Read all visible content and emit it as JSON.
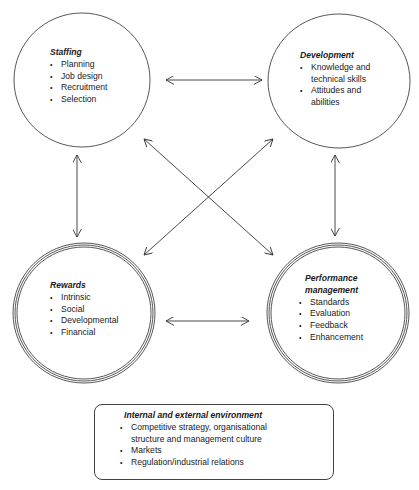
{
  "diagram": {
    "nodes": [
      {
        "id": "staffing",
        "title": "Staffing",
        "border": "single",
        "items": [
          "Planning",
          "Job design",
          "Recruitment",
          "Selection"
        ]
      },
      {
        "id": "development",
        "title": "Development",
        "border": "single",
        "items": [
          "Knowledge and technical skills",
          "Attitudes and abilities"
        ]
      },
      {
        "id": "rewards",
        "title": "Rewards",
        "border": "triple",
        "items": [
          "Intrinsic",
          "Social",
          "Developmental",
          "Financial"
        ]
      },
      {
        "id": "performance",
        "title": "Performance management",
        "border": "triple",
        "items": [
          "Standards",
          "Evaluation",
          "Feedback",
          "Enhancement"
        ]
      }
    ],
    "edges": [
      {
        "from": "staffing",
        "to": "development",
        "type": "bidirectional"
      },
      {
        "from": "staffing",
        "to": "rewards",
        "type": "bidirectional"
      },
      {
        "from": "development",
        "to": "performance",
        "type": "bidirectional"
      },
      {
        "from": "rewards",
        "to": "performance",
        "type": "bidirectional"
      },
      {
        "from": "staffing",
        "to": "performance",
        "type": "bidirectional"
      },
      {
        "from": "development",
        "to": "rewards",
        "type": "bidirectional"
      }
    ],
    "environment": {
      "title": "Internal and external environment",
      "items": [
        "Competitive strategy, organisational structure and management culture",
        "Markets",
        "Regulation/industrial relations"
      ]
    },
    "colors": {
      "line": "#333333",
      "background": "#ffffff"
    }
  }
}
